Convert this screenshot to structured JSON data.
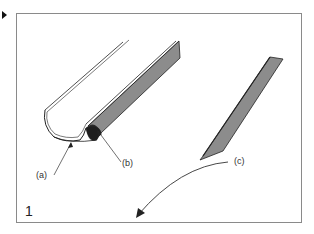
{
  "figure": {
    "number": "1",
    "labels": {
      "a": "(a)",
      "b": "(b)",
      "c": "(c)"
    }
  },
  "colors": {
    "frame": "#8a8a8a",
    "strip_fill": "#8c8c8c",
    "dark_face": "#2a2a2a",
    "line": "#222222"
  }
}
